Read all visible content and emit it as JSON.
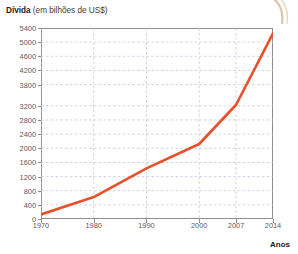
{
  "chart_title": {
    "strong": "Dívida",
    "rest": " (em bilhões de US$)"
  },
  "credit": "Gráfico ©DAE",
  "axis_name_x": "Anos",
  "colors": {
    "line": "#E8502A",
    "grid": "#b9c4d8",
    "frame": "#8e8e8e",
    "tick_text": "#5a5a5a",
    "title_text": "#1a1a1a",
    "credit_text": "#8a8a8a",
    "corner_swoosh": "#d9c3a5"
  },
  "chart_data": {
    "type": "line",
    "title": "Dívida (em bilhões de US$)",
    "xlabel": "Anos",
    "ylabel": "Dívida (em bilhões de US$)",
    "x": [
      1970,
      1980,
      1990,
      2000,
      2007,
      2014
    ],
    "values": [
      130,
      620,
      1430,
      2120,
      3230,
      5250
    ],
    "series": [
      {
        "name": "Dívida",
        "values": [
          130,
          620,
          1430,
          2120,
          3230,
          5250
        ]
      }
    ],
    "xtick_labels": [
      "1970",
      "1980",
      "1990",
      "2000",
      "2007",
      "2014"
    ],
    "ytick_labels": [
      "0",
      "400",
      "800",
      "1200",
      "1600",
      "2000",
      "2400",
      "2800",
      "3200",
      "3800",
      "4200",
      "4600",
      "5000",
      "5400"
    ],
    "ytick_values": [
      0,
      400,
      800,
      1200,
      1600,
      2000,
      2400,
      2800,
      3200,
      3800,
      4200,
      4600,
      5000,
      5400
    ],
    "xlim": [
      1970,
      2014
    ],
    "ylim": [
      0,
      5400
    ],
    "grid": true,
    "legend": "none"
  }
}
